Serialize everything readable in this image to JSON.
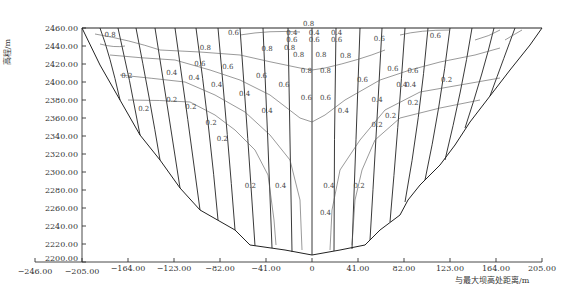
{
  "figure": {
    "type": "dam upstream face contour diagram",
    "y_axis": {
      "title": "高程/m",
      "ticks": [
        "2460.00",
        "2440.00",
        "2420.00",
        "2400.00",
        "2380.00",
        "2360.00",
        "2340.00",
        "2320.00",
        "2300.00",
        "2280.00",
        "2260.00",
        "2240.00",
        "2220.00",
        "2200.00"
      ],
      "range": [
        2200,
        2460
      ]
    },
    "x_axis": {
      "title": "与最大坝高处距离/m",
      "ticks": [
        "-246.00",
        "-205.00",
        "-164.00",
        "-123.00",
        "-82.00",
        "-41.00",
        "0",
        "41.00",
        "82.00",
        "123.00",
        "164.00",
        "205.00"
      ],
      "range": [
        -205,
        205
      ]
    },
    "contour_levels": [
      "0.2",
      "0.4",
      "0.6",
      "0.8"
    ],
    "contour_labels": [
      {
        "text": "0.8",
        "x": -180,
        "y": 2450
      },
      {
        "text": "0.6",
        "x": -70,
        "y": 2452
      },
      {
        "text": "0.8",
        "x": -95,
        "y": 2436
      },
      {
        "text": "0.8",
        "x": -40,
        "y": 2434
      },
      {
        "text": "0.8",
        "x": -20,
        "y": 2436
      },
      {
        "text": "0.6",
        "x": -100,
        "y": 2418
      },
      {
        "text": "0.6",
        "x": -75,
        "y": 2414
      },
      {
        "text": "0.6",
        "x": -45,
        "y": 2404
      },
      {
        "text": "0.6",
        "x": -25,
        "y": 2394
      },
      {
        "text": "0.4",
        "x": -125,
        "y": 2408
      },
      {
        "text": "0.4",
        "x": -105,
        "y": 2402
      },
      {
        "text": "0.4",
        "x": -85,
        "y": 2394
      },
      {
        "text": "0.4",
        "x": -60,
        "y": 2384
      },
      {
        "text": "0.4",
        "x": -40,
        "y": 2366
      },
      {
        "text": "0.2",
        "x": -165,
        "y": 2404
      },
      {
        "text": "0.2",
        "x": -125,
        "y": 2378
      },
      {
        "text": "0.2",
        "x": -108,
        "y": 2370
      },
      {
        "text": "0.2",
        "x": -90,
        "y": 2352
      },
      {
        "text": "0.2",
        "x": -80,
        "y": 2334
      },
      {
        "text": "0.2",
        "x": -55,
        "y": 2282
      },
      {
        "text": "0.4",
        "x": -28,
        "y": 2282
      },
      {
        "text": "0.8",
        "x": -3,
        "y": 2462
      },
      {
        "text": "0.4",
        "x": -18,
        "y": 2452
      },
      {
        "text": "0.6",
        "x": -18,
        "y": 2444
      },
      {
        "text": "0.8",
        "x": -12,
        "y": 2428
      },
      {
        "text": "0.8",
        "x": 8,
        "y": 2428
      },
      {
        "text": "0.8",
        "x": 30,
        "y": 2427
      },
      {
        "text": "0.4",
        "x": 2,
        "y": 2452
      },
      {
        "text": "0.6",
        "x": 2,
        "y": 2444
      },
      {
        "text": "0.4",
        "x": 22,
        "y": 2452
      },
      {
        "text": "0.6",
        "x": 22,
        "y": 2444
      },
      {
        "text": "0.6",
        "x": 60,
        "y": 2446
      },
      {
        "text": "0.6",
        "x": 110,
        "y": 2449
      },
      {
        "text": "0.8",
        "x": -5,
        "y": 2410
      },
      {
        "text": "0.8",
        "x": 12,
        "y": 2410
      },
      {
        "text": "0.6",
        "x": -5,
        "y": 2380
      },
      {
        "text": "0.6",
        "x": 12,
        "y": 2380
      },
      {
        "text": "0.6",
        "x": 45,
        "y": 2400
      },
      {
        "text": "0.6",
        "x": 72,
        "y": 2412
      },
      {
        "text": "0.6",
        "x": 90,
        "y": 2410
      },
      {
        "text": "0.4",
        "x": 28,
        "y": 2366
      },
      {
        "text": "0.4",
        "x": 58,
        "y": 2378
      },
      {
        "text": "0.4",
        "x": 80,
        "y": 2394
      },
      {
        "text": "0.4",
        "x": 88,
        "y": 2394
      },
      {
        "text": "0.2",
        "x": 58,
        "y": 2350
      },
      {
        "text": "0.2",
        "x": 70,
        "y": 2360
      },
      {
        "text": "0.2",
        "x": 90,
        "y": 2374
      },
      {
        "text": "0.2",
        "x": 120,
        "y": 2400
      },
      {
        "text": "0.2",
        "x": -150,
        "y": 2368
      },
      {
        "text": "0.2",
        "x": 42,
        "y": 2282
      },
      {
        "text": "0.4",
        "x": 15,
        "y": 2282
      },
      {
        "text": "0.4",
        "x": 12,
        "y": 2252
      }
    ]
  }
}
